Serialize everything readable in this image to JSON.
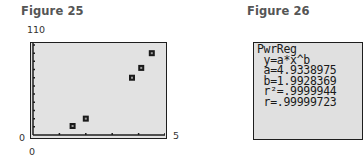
{
  "figures": [
    {
      "title": "Figure 25"
    },
    {
      "title": "Figure 26"
    }
  ],
  "plot": {
    "y_max_label": "110",
    "y_min_label": "0",
    "x_min_label": "0",
    "x_max_label": "5"
  },
  "calculator": {
    "lines": [
      "PwrReg",
      " y=a*x^b",
      " a=4.9338975",
      " b=1.9928369",
      " r²=.9999944",
      " r=.99999723"
    ]
  },
  "chart_data": [
    {
      "type": "scatter",
      "title": "Figure 25",
      "xlabel": "",
      "ylabel": "",
      "xlim": [
        0,
        5
      ],
      "ylim": [
        0,
        110
      ],
      "x_ticks_every": 1,
      "y_ticks_every": 10,
      "grid": false,
      "marker": "square",
      "x": [
        1.5,
        2.0,
        3.75,
        4.1,
        4.5
      ],
      "y": [
        11,
        20,
        70,
        82,
        100
      ],
      "annotations": [
        "110",
        "0",
        "0",
        "5"
      ]
    },
    {
      "type": "table",
      "title": "Figure 26",
      "regression": "PwrReg",
      "model": "y=a*x^b",
      "a": 4.9338975,
      "b": 1.9928369,
      "r_squared": 0.9999944,
      "r": 0.99999723
    }
  ]
}
